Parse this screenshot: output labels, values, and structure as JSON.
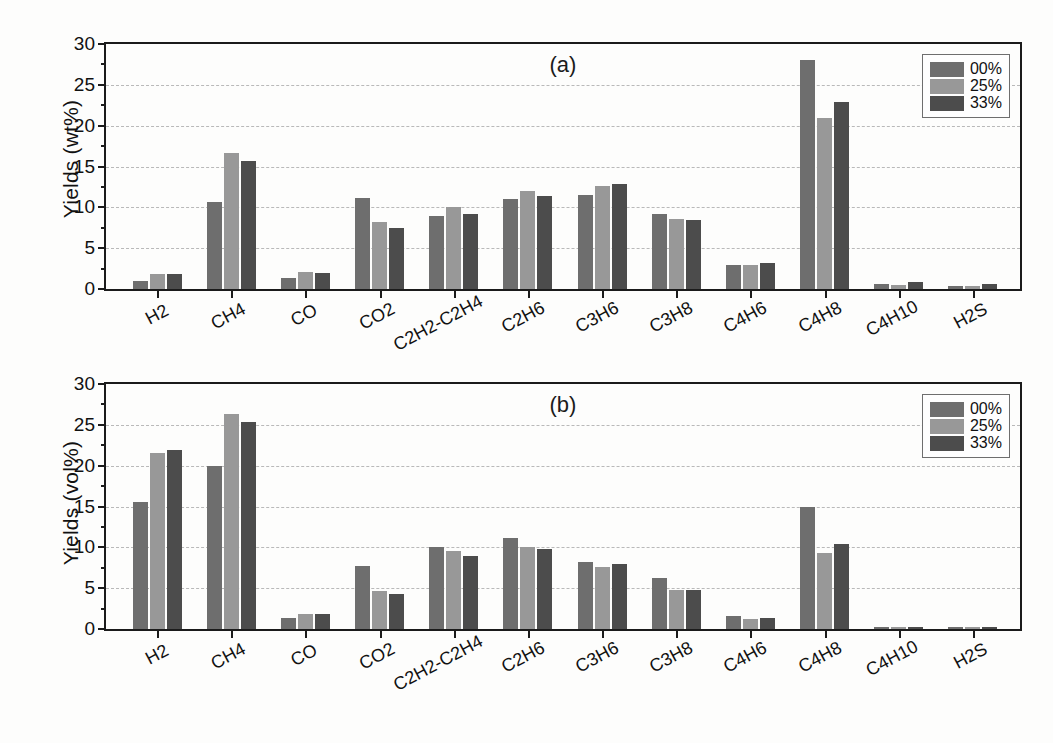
{
  "figure": {
    "background": "#fdfdfc",
    "axis_color": "#1b1b1b",
    "grid_color": "#b9b9b9"
  },
  "series_colors": {
    "00%": "#6e6e6e",
    "25%": "#989898",
    "33%": "#4c4c4c"
  },
  "chart_data": [
    {
      "type": "bar",
      "panel": "(a)",
      "title": "",
      "xlabel": "",
      "ylabel": "Yields (wt%)",
      "ylim": [
        0,
        30
      ],
      "yticks": [
        0,
        5,
        10,
        15,
        20,
        25,
        30
      ],
      "grid": true,
      "legend_position": "top-right",
      "categories": [
        "H2",
        "CH4",
        "CO",
        "CO2",
        "C2H2-C2H4",
        "C2H6",
        "C3H6",
        "C3H8",
        "C4H6",
        "C4H8",
        "C4H10",
        "H2S"
      ],
      "series": [
        {
          "name": "00%",
          "values": [
            1.0,
            10.6,
            1.4,
            11.2,
            8.9,
            11.0,
            11.5,
            9.2,
            3.0,
            28.0,
            0.6,
            0.4
          ]
        },
        {
          "name": "25%",
          "values": [
            1.8,
            16.6,
            2.1,
            8.2,
            10.1,
            12.0,
            12.6,
            8.6,
            2.9,
            21.0,
            0.5,
            0.4
          ]
        },
        {
          "name": "33%",
          "values": [
            1.8,
            15.7,
            1.9,
            7.5,
            9.2,
            11.4,
            12.9,
            8.4,
            3.2,
            22.9,
            0.9,
            0.6
          ]
        }
      ]
    },
    {
      "type": "bar",
      "panel": "(b)",
      "title": "",
      "xlabel": "",
      "ylabel": "Yields (vol%)",
      "ylim": [
        0,
        30
      ],
      "yticks": [
        0,
        5,
        10,
        15,
        20,
        25,
        30
      ],
      "grid": true,
      "legend_position": "top-right",
      "categories": [
        "H2",
        "CH4",
        "CO",
        "CO2",
        "C2H2-C2H4",
        "C2H6",
        "C3H6",
        "C3H8",
        "C4H6",
        "C4H8",
        "C4H10",
        "H2S"
      ],
      "series": [
        {
          "name": "00%",
          "values": [
            15.5,
            20.0,
            1.4,
            7.7,
            10.0,
            11.1,
            8.2,
            6.2,
            1.6,
            15.0,
            0.2,
            0.3
          ]
        },
        {
          "name": "25%",
          "values": [
            21.5,
            26.3,
            1.8,
            4.7,
            9.6,
            10.0,
            7.6,
            4.8,
            1.2,
            9.3,
            0.2,
            0.3
          ]
        },
        {
          "name": "33%",
          "values": [
            21.9,
            25.3,
            1.8,
            4.3,
            9.0,
            9.8,
            7.9,
            4.8,
            1.4,
            10.4,
            0.3,
            0.3
          ]
        }
      ]
    }
  ]
}
